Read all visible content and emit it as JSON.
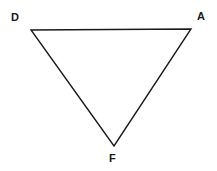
{
  "figure": {
    "type": "triangle-diagram",
    "background_color": "#ffffff",
    "stroke_color": "#1a1a1a",
    "stroke_width": 1.4,
    "fill": "none",
    "width": 217,
    "height": 171,
    "labels": {
      "d": "D",
      "a": "A",
      "f": "F"
    },
    "label_color": "#1a1a1a",
    "vertices": [
      {
        "name": "D",
        "x": 31,
        "y": 30
      },
      {
        "name": "A",
        "x": 191,
        "y": 29
      },
      {
        "name": "F",
        "x": 114,
        "y": 146
      }
    ],
    "edges": [
      {
        "name": "DA",
        "from": "D",
        "to": "A"
      },
      {
        "name": "AF",
        "from": "A",
        "to": "F"
      },
      {
        "name": "FD",
        "from": "F",
        "to": "D"
      }
    ],
    "polygon_points": "31,30 191,29 114,146"
  }
}
